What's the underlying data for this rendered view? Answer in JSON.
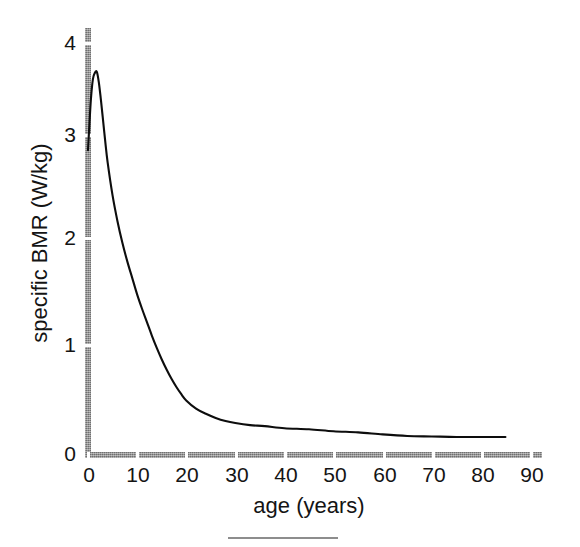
{
  "chart_data": {
    "type": "line",
    "title": "",
    "xlabel": "age (years)",
    "ylabel": "specific BMR (W/kg)",
    "xlim": [
      0,
      93
    ],
    "ylim": [
      0,
      4.3
    ],
    "xticks": [
      0,
      10,
      20,
      30,
      40,
      50,
      60,
      70,
      80,
      90
    ],
    "xtick_labels": [
      "0",
      "10",
      "20",
      "30",
      "40",
      "50",
      "60",
      "70",
      "80",
      "90"
    ],
    "yticks": [
      0,
      1,
      2,
      3,
      4
    ],
    "ytick_labels": [
      "0",
      "1",
      "2",
      "3",
      "4"
    ],
    "grid": false,
    "legend": false,
    "series": [
      {
        "name": "specific BMR",
        "x": [
          0,
          0.3,
          0.6,
          1.0,
          1.4,
          1.8,
          2.2,
          2.6,
          3.0,
          3.5,
          4,
          5,
          6,
          7,
          8,
          9,
          10,
          11,
          12,
          13,
          14,
          15,
          16,
          17,
          18,
          19,
          20,
          22,
          24,
          26,
          28,
          30,
          33,
          36,
          40,
          45,
          50,
          55,
          60,
          65,
          70,
          75,
          80,
          85
        ],
        "y": [
          2.96,
          3.22,
          3.46,
          3.65,
          3.71,
          3.72,
          3.62,
          3.46,
          3.28,
          3.05,
          2.84,
          2.52,
          2.27,
          2.06,
          1.88,
          1.72,
          1.56,
          1.42,
          1.29,
          1.16,
          1.04,
          0.93,
          0.83,
          0.74,
          0.66,
          0.59,
          0.53,
          0.45,
          0.4,
          0.36,
          0.33,
          0.31,
          0.29,
          0.28,
          0.26,
          0.25,
          0.23,
          0.22,
          0.2,
          0.185,
          0.18,
          0.175,
          0.175,
          0.175
        ]
      }
    ],
    "annotations": [],
    "axis_color": "#8f8f8f",
    "curve_color": "#0d0d0d",
    "background_color": "#ffffff"
  },
  "axes": {
    "y_title": "specific BMR (W/kg)",
    "x_title": "age (years)",
    "y_tick_labels": [
      "4",
      "3",
      "2",
      "1",
      "0"
    ],
    "x_tick_labels": [
      "0",
      "10",
      "20",
      "30",
      "40",
      "50",
      "60",
      "70",
      "80",
      "90"
    ]
  }
}
